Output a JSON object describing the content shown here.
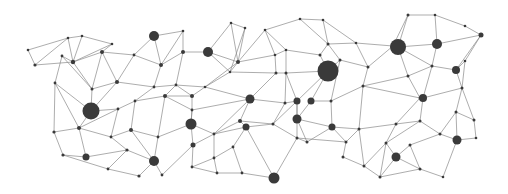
{
  "diagram": {
    "type": "network-graph",
    "style": {
      "background": "#ffffff",
      "edge_color": "#8a8a8a",
      "node_color": "#3a3a3a"
    },
    "nodes": [
      {
        "id": 0,
        "x": 28,
        "y": 50,
        "r": 1.3
      },
      {
        "id": 1,
        "x": 35,
        "y": 65,
        "r": 1.6
      },
      {
        "id": 2,
        "x": 68,
        "y": 38,
        "r": 1.3
      },
      {
        "id": 3,
        "x": 62,
        "y": 56,
        "r": 1.4
      },
      {
        "id": 4,
        "x": 82,
        "y": 36,
        "r": 1.3
      },
      {
        "id": 5,
        "x": 73,
        "y": 62,
        "r": 2.2
      },
      {
        "id": 6,
        "x": 112,
        "y": 44,
        "r": 1.3
      },
      {
        "id": 7,
        "x": 102,
        "y": 52,
        "r": 2.0
      },
      {
        "id": 8,
        "x": 55,
        "y": 83,
        "r": 1.4
      },
      {
        "id": 9,
        "x": 92,
        "y": 89,
        "r": 1.5
      },
      {
        "id": 10,
        "x": 117,
        "y": 82,
        "r": 2.0
      },
      {
        "id": 11,
        "x": 134,
        "y": 55,
        "r": 1.4
      },
      {
        "id": 12,
        "x": 154,
        "y": 36,
        "r": 5.0
      },
      {
        "id": 13,
        "x": 183,
        "y": 31,
        "r": 1.3
      },
      {
        "id": 14,
        "x": 161,
        "y": 65,
        "r": 2.0
      },
      {
        "id": 15,
        "x": 183,
        "y": 52,
        "r": 2.0
      },
      {
        "id": 16,
        "x": 208,
        "y": 52,
        "r": 5.0
      },
      {
        "id": 17,
        "x": 231,
        "y": 23,
        "r": 1.3
      },
      {
        "id": 18,
        "x": 245,
        "y": 28,
        "r": 1.3
      },
      {
        "id": 19,
        "x": 238,
        "y": 62,
        "r": 2.0
      },
      {
        "id": 20,
        "x": 230,
        "y": 72,
        "r": 1.3
      },
      {
        "id": 21,
        "x": 154,
        "y": 87,
        "r": 1.4
      },
      {
        "id": 22,
        "x": 176,
        "y": 85,
        "r": 1.4
      },
      {
        "id": 23,
        "x": 192,
        "y": 96,
        "r": 2.0
      },
      {
        "id": 24,
        "x": 205,
        "y": 87,
        "r": 1.3
      },
      {
        "id": 25,
        "x": 91,
        "y": 111,
        "r": 8.5
      },
      {
        "id": 26,
        "x": 118,
        "y": 109,
        "r": 1.4
      },
      {
        "id": 27,
        "x": 135,
        "y": 101,
        "r": 1.4
      },
      {
        "id": 28,
        "x": 165,
        "y": 96,
        "r": 2.0
      },
      {
        "id": 29,
        "x": 192,
        "y": 110,
        "r": 1.4
      },
      {
        "id": 30,
        "x": 54,
        "y": 132,
        "r": 1.6
      },
      {
        "id": 31,
        "x": 79,
        "y": 128,
        "r": 2.0
      },
      {
        "id": 32,
        "x": 111,
        "y": 137,
        "r": 1.4
      },
      {
        "id": 33,
        "x": 131,
        "y": 130,
        "r": 2.0
      },
      {
        "id": 34,
        "x": 158,
        "y": 137,
        "r": 1.4
      },
      {
        "id": 35,
        "x": 191,
        "y": 124,
        "r": 5.5
      },
      {
        "id": 36,
        "x": 214,
        "y": 134,
        "r": 1.4
      },
      {
        "id": 37,
        "x": 240,
        "y": 121,
        "r": 2.0
      },
      {
        "id": 38,
        "x": 250,
        "y": 99,
        "r": 4.5
      },
      {
        "id": 39,
        "x": 246,
        "y": 127,
        "r": 3.5
      },
      {
        "id": 40,
        "x": 63,
        "y": 155,
        "r": 1.6
      },
      {
        "id": 41,
        "x": 86,
        "y": 157,
        "r": 3.5
      },
      {
        "id": 42,
        "x": 127,
        "y": 150,
        "r": 1.6
      },
      {
        "id": 43,
        "x": 154,
        "y": 161,
        "r": 5.0
      },
      {
        "id": 44,
        "x": 108,
        "y": 169,
        "r": 1.4
      },
      {
        "id": 45,
        "x": 139,
        "y": 176,
        "r": 1.6
      },
      {
        "id": 46,
        "x": 162,
        "y": 175,
        "r": 1.4
      },
      {
        "id": 47,
        "x": 193,
        "y": 145,
        "r": 2.5
      },
      {
        "id": 48,
        "x": 192,
        "y": 167,
        "r": 1.4
      },
      {
        "id": 49,
        "x": 214,
        "y": 158,
        "r": 1.4
      },
      {
        "id": 50,
        "x": 217,
        "y": 173,
        "r": 1.4
      },
      {
        "id": 51,
        "x": 242,
        "y": 173,
        "r": 1.4
      },
      {
        "id": 52,
        "x": 233,
        "y": 147,
        "r": 1.4
      },
      {
        "id": 53,
        "x": 274,
        "y": 178,
        "r": 5.5
      },
      {
        "id": 54,
        "x": 265,
        "y": 30,
        "r": 1.3
      },
      {
        "id": 55,
        "x": 275,
        "y": 55,
        "r": 1.3
      },
      {
        "id": 56,
        "x": 286,
        "y": 50,
        "r": 1.3
      },
      {
        "id": 57,
        "x": 276,
        "y": 73,
        "r": 1.5
      },
      {
        "id": 58,
        "x": 286,
        "y": 73,
        "r": 1.5
      },
      {
        "id": 59,
        "x": 285,
        "y": 103,
        "r": 1.5
      },
      {
        "id": 60,
        "x": 297,
        "y": 101,
        "r": 3.5
      },
      {
        "id": 61,
        "x": 273,
        "y": 124,
        "r": 1.5
      },
      {
        "id": 62,
        "x": 297,
        "y": 138,
        "r": 1.5
      },
      {
        "id": 63,
        "x": 300,
        "y": 19,
        "r": 1.3
      },
      {
        "id": 64,
        "x": 323,
        "y": 20,
        "r": 1.3
      },
      {
        "id": 65,
        "x": 328,
        "y": 44,
        "r": 1.5
      },
      {
        "id": 66,
        "x": 320,
        "y": 55,
        "r": 1.5
      },
      {
        "id": 67,
        "x": 328,
        "y": 71,
        "r": 10.5
      },
      {
        "id": 68,
        "x": 340,
        "y": 60,
        "r": 1.5
      },
      {
        "id": 69,
        "x": 331,
        "y": 101,
        "r": 1.5
      },
      {
        "id": 70,
        "x": 311,
        "y": 101,
        "r": 3.5
      },
      {
        "id": 71,
        "x": 297,
        "y": 119,
        "r": 4.5
      },
      {
        "id": 72,
        "x": 332,
        "y": 127,
        "r": 3.5
      },
      {
        "id": 73,
        "x": 346,
        "y": 142,
        "r": 1.5
      },
      {
        "id": 74,
        "x": 307,
        "y": 142,
        "r": 1.5
      },
      {
        "id": 75,
        "x": 356,
        "y": 43,
        "r": 1.3
      },
      {
        "id": 76,
        "x": 368,
        "y": 67,
        "r": 1.5
      },
      {
        "id": 77,
        "x": 363,
        "y": 86,
        "r": 1.5
      },
      {
        "id": 78,
        "x": 359,
        "y": 129,
        "r": 1.5
      },
      {
        "id": 79,
        "x": 364,
        "y": 166,
        "r": 1.5
      },
      {
        "id": 80,
        "x": 343,
        "y": 157,
        "r": 1.5
      },
      {
        "id": 81,
        "x": 393,
        "y": 46,
        "r": 1.5
      },
      {
        "id": 82,
        "x": 398,
        "y": 47,
        "r": 8.0
      },
      {
        "id": 83,
        "x": 408,
        "y": 15,
        "r": 1.5
      },
      {
        "id": 84,
        "x": 435,
        "y": 15,
        "r": 1.3
      },
      {
        "id": 85,
        "x": 437,
        "y": 44,
        "r": 5.0
      },
      {
        "id": 86,
        "x": 465,
        "y": 26,
        "r": 1.3
      },
      {
        "id": 87,
        "x": 481,
        "y": 35,
        "r": 2.5
      },
      {
        "id": 88,
        "x": 408,
        "y": 76,
        "r": 1.5
      },
      {
        "id": 89,
        "x": 432,
        "y": 66,
        "r": 1.5
      },
      {
        "id": 90,
        "x": 456,
        "y": 70,
        "r": 4.0
      },
      {
        "id": 91,
        "x": 465,
        "y": 61,
        "r": 1.3
      },
      {
        "id": 92,
        "x": 420,
        "y": 98,
        "r": 1.5
      },
      {
        "id": 93,
        "x": 423,
        "y": 98,
        "r": 4.0
      },
      {
        "id": 94,
        "x": 462,
        "y": 88,
        "r": 1.5
      },
      {
        "id": 95,
        "x": 396,
        "y": 124,
        "r": 1.5
      },
      {
        "id": 96,
        "x": 420,
        "y": 121,
        "r": 1.5
      },
      {
        "id": 97,
        "x": 440,
        "y": 134,
        "r": 1.5
      },
      {
        "id": 98,
        "x": 456,
        "y": 112,
        "r": 1.5
      },
      {
        "id": 99,
        "x": 474,
        "y": 120,
        "r": 1.5
      },
      {
        "id": 100,
        "x": 476,
        "y": 138,
        "r": 1.3
      },
      {
        "id": 101,
        "x": 457,
        "y": 140,
        "r": 4.5
      },
      {
        "id": 102,
        "x": 396,
        "y": 157,
        "r": 4.5
      },
      {
        "id": 103,
        "x": 386,
        "y": 143,
        "r": 1.5
      },
      {
        "id": 104,
        "x": 420,
        "y": 169,
        "r": 1.5
      },
      {
        "id": 105,
        "x": 443,
        "y": 177,
        "r": 1.3
      },
      {
        "id": 106,
        "x": 380,
        "y": 177,
        "r": 1.5
      },
      {
        "id": 107,
        "x": 410,
        "y": 145,
        "r": 1.5
      }
    ],
    "edges": [
      [
        0,
        1
      ],
      [
        0,
        2
      ],
      [
        1,
        2
      ],
      [
        1,
        5
      ],
      [
        2,
        4
      ],
      [
        2,
        5
      ],
      [
        4,
        5
      ],
      [
        4,
        6
      ],
      [
        5,
        6
      ],
      [
        5,
        7
      ],
      [
        6,
        7
      ],
      [
        3,
        5
      ],
      [
        3,
        8
      ],
      [
        3,
        9
      ],
      [
        5,
        9
      ],
      [
        7,
        9
      ],
      [
        7,
        10
      ],
      [
        7,
        11
      ],
      [
        9,
        10
      ],
      [
        10,
        11
      ],
      [
        11,
        12
      ],
      [
        11,
        14
      ],
      [
        12,
        13
      ],
      [
        12,
        14
      ],
      [
        13,
        14
      ],
      [
        13,
        15
      ],
      [
        14,
        15
      ],
      [
        15,
        16
      ],
      [
        16,
        19
      ],
      [
        16,
        17
      ],
      [
        17,
        18
      ],
      [
        17,
        19
      ],
      [
        18,
        19
      ],
      [
        18,
        20
      ],
      [
        19,
        20
      ],
      [
        14,
        21
      ],
      [
        10,
        21
      ],
      [
        21,
        22
      ],
      [
        22,
        15
      ],
      [
        22,
        23
      ],
      [
        22,
        24
      ],
      [
        24,
        20
      ],
      [
        24,
        19
      ],
      [
        23,
        24
      ],
      [
        8,
        25
      ],
      [
        8,
        30
      ],
      [
        9,
        25
      ],
      [
        25,
        26
      ],
      [
        25,
        10
      ],
      [
        26,
        27
      ],
      [
        27,
        21
      ],
      [
        27,
        28
      ],
      [
        28,
        22
      ],
      [
        28,
        23
      ],
      [
        28,
        29
      ],
      [
        29,
        23
      ],
      [
        29,
        35
      ],
      [
        8,
        31
      ],
      [
        30,
        31
      ],
      [
        25,
        31
      ],
      [
        31,
        26
      ],
      [
        26,
        32
      ],
      [
        31,
        32
      ],
      [
        32,
        33
      ],
      [
        33,
        27
      ],
      [
        33,
        34
      ],
      [
        34,
        28
      ],
      [
        34,
        35
      ],
      [
        35,
        29
      ],
      [
        35,
        36
      ],
      [
        36,
        37
      ],
      [
        36,
        38
      ],
      [
        37,
        38
      ],
      [
        38,
        29
      ],
      [
        38,
        24
      ],
      [
        37,
        39
      ],
      [
        39,
        36
      ],
      [
        30,
        40
      ],
      [
        40,
        41
      ],
      [
        31,
        41
      ],
      [
        41,
        42
      ],
      [
        32,
        42
      ],
      [
        42,
        43
      ],
      [
        33,
        43
      ],
      [
        43,
        34
      ],
      [
        42,
        44
      ],
      [
        40,
        44
      ],
      [
        44,
        45
      ],
      [
        45,
        43
      ],
      [
        43,
        46
      ],
      [
        46,
        47
      ],
      [
        47,
        35
      ],
      [
        47,
        36
      ],
      [
        47,
        48
      ],
      [
        48,
        49
      ],
      [
        49,
        36
      ],
      [
        49,
        50
      ],
      [
        48,
        50
      ],
      [
        50,
        51
      ],
      [
        51,
        52
      ],
      [
        52,
        49
      ],
      [
        52,
        39
      ],
      [
        51,
        53
      ],
      [
        53,
        39
      ],
      [
        16,
        20
      ],
      [
        19,
        54
      ],
      [
        54,
        55
      ],
      [
        55,
        19
      ],
      [
        55,
        56
      ],
      [
        54,
        56
      ],
      [
        56,
        58
      ],
      [
        58,
        57
      ],
      [
        57,
        55
      ],
      [
        57,
        38
      ],
      [
        57,
        20
      ],
      [
        58,
        59
      ],
      [
        59,
        38
      ],
      [
        59,
        60
      ],
      [
        60,
        58
      ],
      [
        60,
        61
      ],
      [
        61,
        59
      ],
      [
        61,
        37
      ],
      [
        61,
        39
      ],
      [
        60,
        62
      ],
      [
        62,
        61
      ],
      [
        62,
        53
      ],
      [
        54,
        63
      ],
      [
        63,
        64
      ],
      [
        64,
        65
      ],
      [
        63,
        65
      ],
      [
        65,
        66
      ],
      [
        66,
        56
      ],
      [
        66,
        67
      ],
      [
        67,
        58
      ],
      [
        67,
        68
      ],
      [
        68,
        65
      ],
      [
        67,
        60
      ],
      [
        67,
        70
      ],
      [
        70,
        69
      ],
      [
        69,
        68
      ],
      [
        70,
        71
      ],
      [
        71,
        60
      ],
      [
        71,
        72
      ],
      [
        72,
        69
      ],
      [
        72,
        73
      ],
      [
        73,
        62
      ],
      [
        71,
        74
      ],
      [
        74,
        62
      ],
      [
        74,
        72
      ],
      [
        64,
        75
      ],
      [
        75,
        65
      ],
      [
        75,
        76
      ],
      [
        76,
        68
      ],
      [
        76,
        77
      ],
      [
        77,
        69
      ],
      [
        77,
        78
      ],
      [
        78,
        72
      ],
      [
        78,
        73
      ],
      [
        73,
        80
      ],
      [
        80,
        79
      ],
      [
        79,
        78
      ],
      [
        76,
        81
      ],
      [
        75,
        81
      ],
      [
        81,
        82
      ],
      [
        82,
        83
      ],
      [
        83,
        84
      ],
      [
        84,
        85
      ],
      [
        82,
        85
      ],
      [
        83,
        81
      ],
      [
        84,
        86
      ],
      [
        86,
        87
      ],
      [
        85,
        87
      ],
      [
        85,
        89
      ],
      [
        89,
        82
      ],
      [
        82,
        88
      ],
      [
        88,
        77
      ],
      [
        88,
        89
      ],
      [
        89,
        90
      ],
      [
        90,
        87
      ],
      [
        90,
        91
      ],
      [
        91,
        87
      ],
      [
        89,
        93
      ],
      [
        88,
        92
      ],
      [
        92,
        93
      ],
      [
        93,
        94
      ],
      [
        94,
        90
      ],
      [
        94,
        91
      ],
      [
        92,
        77
      ],
      [
        92,
        95
      ],
      [
        95,
        78
      ],
      [
        95,
        96
      ],
      [
        96,
        93
      ],
      [
        96,
        97
      ],
      [
        97,
        98
      ],
      [
        98,
        94
      ],
      [
        98,
        99
      ],
      [
        99,
        94
      ],
      [
        99,
        100
      ],
      [
        100,
        101
      ],
      [
        101,
        98
      ],
      [
        97,
        101
      ],
      [
        96,
        103
      ],
      [
        95,
        103
      ],
      [
        103,
        102
      ],
      [
        102,
        107
      ],
      [
        107,
        97
      ],
      [
        102,
        104
      ],
      [
        104,
        107
      ],
      [
        104,
        105
      ],
      [
        105,
        101
      ],
      [
        103,
        106
      ],
      [
        106,
        102
      ],
      [
        106,
        79
      ],
      [
        79,
        103
      ],
      [
        106,
        104
      ]
    ]
  }
}
